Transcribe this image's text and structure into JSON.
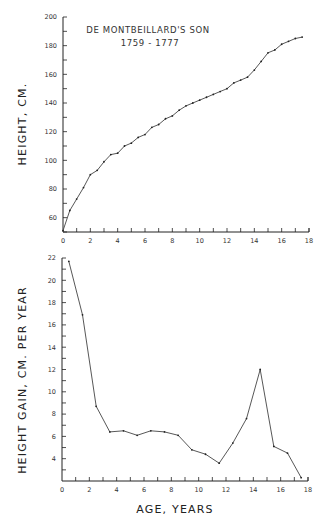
{
  "chart_data": [
    {
      "type": "line",
      "title": "DE MONTBEILLARD'S SON",
      "subtitle": "1759 - 1777",
      "xlabel": "",
      "ylabel": "HEIGHT, CM.",
      "xlim": [
        0,
        18
      ],
      "ylim": [
        50,
        200
      ],
      "xticks": [
        0,
        2,
        4,
        6,
        8,
        10,
        12,
        14,
        16,
        18
      ],
      "xtick_labels": [
        "0",
        "2",
        "4",
        "6",
        "8",
        "10",
        "12",
        "14",
        "16",
        "18"
      ],
      "yticks": [
        60,
        80,
        100,
        120,
        140,
        160,
        180,
        200
      ],
      "grid": false,
      "x": [
        0,
        0.5,
        1,
        1.5,
        2,
        2.5,
        3,
        3.5,
        4,
        4.5,
        5,
        5.5,
        6,
        6.5,
        7,
        7.5,
        8,
        8.5,
        9,
        9.5,
        10,
        10.5,
        11,
        11.5,
        12,
        12.5,
        13,
        13.5,
        14,
        14.5,
        15,
        15.5,
        16,
        16.5,
        17,
        17.5
      ],
      "values": [
        51,
        65,
        73,
        81,
        90,
        93,
        99,
        104,
        105,
        110,
        112,
        116,
        118,
        123,
        125,
        129,
        131,
        135,
        138,
        140,
        142,
        144,
        146,
        148,
        150,
        154,
        156,
        158,
        163,
        169,
        175,
        177,
        181,
        183,
        185,
        186
      ]
    },
    {
      "type": "line",
      "title": "",
      "xlabel": "AGE, YEARS",
      "ylabel": "HEIGHT GAIN, CM. PER YEAR",
      "xlim": [
        0,
        18
      ],
      "ylim": [
        2,
        22
      ],
      "xticks": [
        0,
        2,
        4,
        6,
        8,
        10,
        12,
        14,
        16,
        18
      ],
      "xtick_labels": [
        "0",
        "2",
        "4",
        "6",
        "8",
        "10",
        "12",
        "14",
        "16",
        "18"
      ],
      "yticks": [
        4,
        6,
        8,
        10,
        12,
        14,
        16,
        18,
        20,
        22
      ],
      "grid": false,
      "x": [
        0.5,
        1.5,
        2.5,
        3.5,
        4.5,
        5.5,
        6.5,
        7.5,
        8.5,
        9.5,
        10.5,
        11.5,
        12.5,
        13.5,
        14.5,
        15.5,
        16.5,
        17.5
      ],
      "values": [
        21.7,
        16.9,
        8.7,
        6.4,
        6.5,
        6.1,
        6.5,
        6.4,
        6.1,
        4.8,
        4.4,
        3.6,
        5.4,
        7.6,
        12.0,
        5.1,
        4.5,
        2.3
      ]
    }
  ],
  "labels": {
    "title": "DE MONTBEILLARD'S SON",
    "subtitle": "1759 - 1777",
    "top_ylabel": "HEIGHT, CM.",
    "bottom_ylabel": "HEIGHT GAIN, CM. PER YEAR",
    "xlabel": "AGE, YEARS"
  },
  "style": {
    "line_color": "#444444",
    "axis_color": "#222222"
  }
}
